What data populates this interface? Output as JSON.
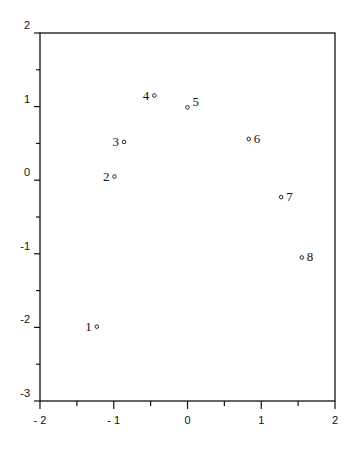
{
  "chart_data": {
    "type": "scatter",
    "title": "",
    "xlabel": "",
    "ylabel": "",
    "xlim": [
      -2,
      2
    ],
    "ylim": [
      -3,
      2
    ],
    "grid": false,
    "x_ticks": [
      "-2",
      "-1",
      "0",
      "1",
      "2"
    ],
    "y_ticks": [
      "2",
      "1",
      "0",
      "-1",
      "-2",
      "-3"
    ],
    "points": [
      {
        "label": "1",
        "x": -1.23,
        "y": -1.99
      },
      {
        "label": "2",
        "x": -0.99,
        "y": 0.05
      },
      {
        "label": "3",
        "x": -0.86,
        "y": 0.52
      },
      {
        "label": "4",
        "x": -0.45,
        "y": 1.15
      },
      {
        "label": "5",
        "x": 0.0,
        "y": 0.99
      },
      {
        "label": "6",
        "x": 0.83,
        "y": 0.56
      },
      {
        "label": "7",
        "x": 1.27,
        "y": -0.23
      },
      {
        "label": "8",
        "x": 1.55,
        "y": -1.05
      }
    ]
  }
}
